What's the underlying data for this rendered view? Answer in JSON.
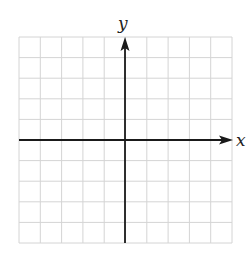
{
  "diagram": {
    "type": "coordinate-plane",
    "x_axis_label": "x",
    "y_axis_label": "y",
    "grid": {
      "columns": 10,
      "rows": 10,
      "left": 19,
      "top": 37,
      "right": 232,
      "bottom": 243,
      "line_color": "#d4d4d4"
    },
    "axes": {
      "origin_px": [
        125,
        140
      ],
      "color": "#1a1a1a",
      "x_arrow_tip": 233,
      "y_arrow_tip": 37
    }
  }
}
